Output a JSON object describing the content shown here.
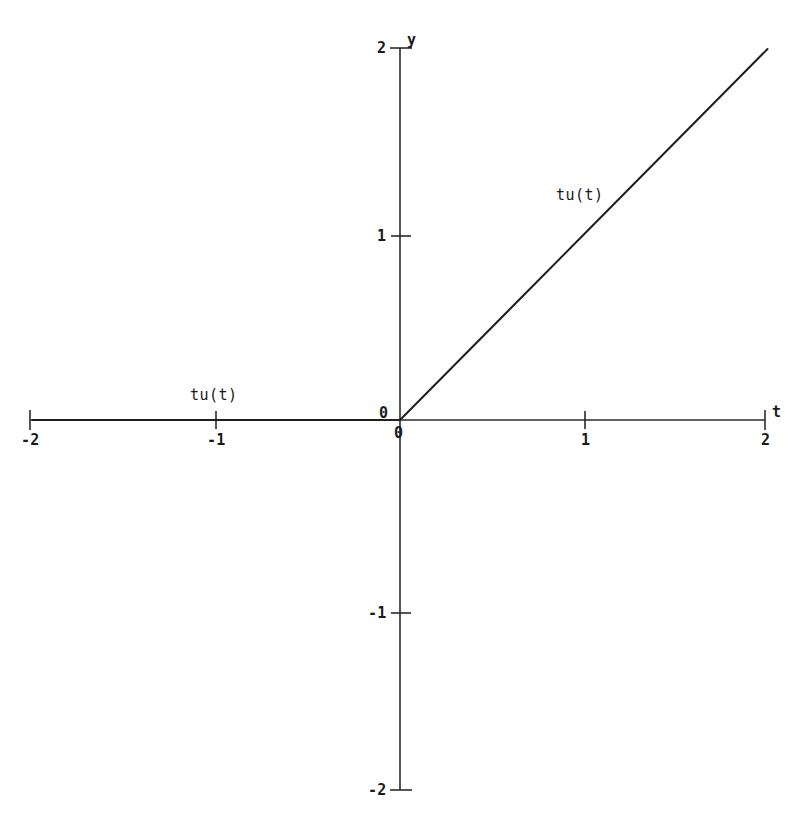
{
  "chart_data": {
    "type": "line",
    "title": "",
    "subtitle": "",
    "xlabel": "t",
    "ylabel": "y",
    "xlim": [
      -2,
      2
    ],
    "ylim": [
      -2,
      2
    ],
    "grid": false,
    "legend": "inline-labels",
    "xticks": [
      -2,
      -1,
      0,
      1,
      2
    ],
    "xtick_labels": [
      "-2",
      "-1",
      "0",
      "1",
      "2"
    ],
    "yticks": [
      -2,
      -1,
      0,
      1,
      2
    ],
    "ytick_labels": [
      "-2",
      "-1",
      "0",
      "1",
      "2"
    ],
    "origin_labels": [
      "0",
      "0"
    ],
    "series": [
      {
        "name": "tu(t)",
        "description": "unit ramp: t times unit step u(t)",
        "x": [
          -2,
          -1,
          0,
          1,
          2
        ],
        "values": [
          0,
          0,
          0,
          1,
          2
        ]
      }
    ],
    "annotations": [
      {
        "text": "tu(t)",
        "x": -1.05,
        "y": 0.2
      },
      {
        "text": "tu(t)",
        "x": 0.85,
        "y": 1.28
      }
    ]
  },
  "axes": {
    "x_name": "t",
    "y_name": "y",
    "x_tick_labels": [
      "-2",
      "-1",
      "1",
      "2"
    ],
    "y_tick_labels": [
      "2",
      "1",
      "-1",
      "-2"
    ],
    "origin_label_x": "0",
    "origin_label_y": "0"
  },
  "series_labels": {
    "left": "tu(t)",
    "right": "tu(t)"
  },
  "colors": {
    "background": "#ffffff",
    "axis": "#2b2b2b",
    "curve": "#1f1f1f",
    "text": "#1a1a1a"
  }
}
